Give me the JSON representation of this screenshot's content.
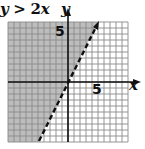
{
  "chart_data": {
    "type": "inequality-graph",
    "title": "y > 2x",
    "title_parts": {
      "lhs": "y",
      "op": ">",
      "rhs": "2x"
    },
    "xlabel": "x",
    "ylabel": "y",
    "xlim": [
      -10,
      10
    ],
    "ylim": [
      -10,
      10
    ],
    "grid": true,
    "grid_step": 1,
    "tick_labels": {
      "x": [
        "5"
      ],
      "y": [
        "5"
      ]
    },
    "boundary": {
      "equation": "y = 2x",
      "slope": 2,
      "intercept": 0,
      "style": "dashed",
      "points": [
        [
          -5,
          -10
        ],
        [
          5,
          10
        ]
      ]
    },
    "shaded_region": "above/left of boundary (y > 2x)",
    "colors": {
      "shade": "#bdbdbd",
      "grid": "#8a8a8a",
      "axis": "#111111",
      "boundary": "#111111"
    }
  },
  "labels": {
    "title_lhs": "y",
    "title_op": " > ",
    "title_num": "2",
    "title_var": "x",
    "y_axis": "y",
    "x_axis": "x",
    "y_tick": "5",
    "x_tick": "5"
  }
}
